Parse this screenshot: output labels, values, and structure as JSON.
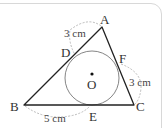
{
  "diagram": {
    "type": "geometry",
    "points": {
      "A": "A",
      "B": "B",
      "C": "C",
      "D": "D",
      "E": "E",
      "F": "F",
      "O": "O"
    },
    "measurements": {
      "AD": "3 cm",
      "CF": "3 cm",
      "BE": "5 cm"
    },
    "colors": {
      "line": "#222222",
      "circle": "#777777",
      "dashed": "#aaaaaa",
      "frame": "#d8d8d8"
    }
  }
}
